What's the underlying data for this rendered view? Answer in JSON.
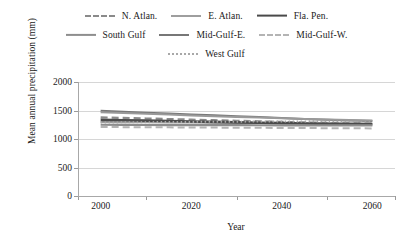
{
  "chart_data": {
    "type": "line",
    "title": "",
    "xlabel": "Year",
    "ylabel": "Mean annual precipitation (mm)",
    "xlim": [
      1995,
      2065
    ],
    "ylim": [
      0,
      2000
    ],
    "xticks": [
      2000,
      2020,
      2040,
      2060
    ],
    "yticks": [
      0,
      500,
      1000,
      1500,
      2000
    ],
    "grid": true,
    "legend_position": "top",
    "x": [
      2000,
      2005,
      2010,
      2015,
      2020,
      2025,
      2030,
      2035,
      2040,
      2045,
      2050,
      2055,
      2060
    ],
    "series": [
      {
        "name": "N. Atlan.",
        "style": "dashed",
        "color": "#8a8a8a",
        "width": 2.2,
        "values": [
          1380,
          1370,
          1360,
          1350,
          1340,
          1330,
          1320,
          1310,
          1300,
          1290,
          1285,
          1280,
          1275
        ]
      },
      {
        "name": "E. Atlan.",
        "style": "solid",
        "color": "#9e9e9e",
        "width": 2.0,
        "values": [
          1300,
          1295,
          1292,
          1290,
          1288,
          1286,
          1283,
          1280,
          1278,
          1276,
          1274,
          1272,
          1270
        ]
      },
      {
        "name": "Fla. Pen.",
        "style": "solid",
        "color": "#4a4a4a",
        "width": 2.6,
        "values": [
          1335,
          1330,
          1322,
          1315,
          1308,
          1300,
          1292,
          1285,
          1278,
          1272,
          1266,
          1262,
          1258
        ]
      },
      {
        "name": "South Gulf",
        "style": "solid",
        "color": "#8e8e8e",
        "width": 2.2,
        "values": [
          1250,
          1248,
          1246,
          1245,
          1244,
          1243,
          1242,
          1241,
          1240,
          1240,
          1239,
          1238,
          1238
        ]
      },
      {
        "name": "Mid-Gulf-E.",
        "style": "solid",
        "color": "#777777",
        "width": 2.0,
        "values": [
          1495,
          1480,
          1462,
          1448,
          1432,
          1416,
          1400,
          1384,
          1368,
          1352,
          1338,
          1326,
          1315
        ]
      },
      {
        "name": "Mid-Gulf-W.",
        "style": "dashed",
        "color": "#b4b4b4",
        "width": 2.0,
        "values": [
          1210,
          1208,
          1206,
          1204,
          1202,
          1200,
          1198,
          1196,
          1194,
          1192,
          1190,
          1188,
          1186
        ]
      },
      {
        "name": "West Gulf",
        "style": "dotted",
        "color": "#a8a8a8",
        "width": 2.0,
        "values": [
          1290,
          1292,
          1295,
          1298,
          1300,
          1302,
          1304,
          1306,
          1308,
          1309,
          1310,
          1311,
          1312
        ]
      },
      {
        "name": "Mid-Gulf-E. upper",
        "style": "solid",
        "color": "#9a9a9a",
        "width": 2.0,
        "values": [
          1470,
          1456,
          1442,
          1428,
          1414,
          1400,
          1388,
          1376,
          1364,
          1352,
          1342,
          1334,
          1326
        ]
      }
    ]
  },
  "legend": {
    "rows": [
      [
        {
          "label": "N. Atlan.",
          "style": "dashed",
          "color": "#8a8a8a",
          "width": 2.2
        },
        {
          "label": "E. Atlan.",
          "style": "solid",
          "color": "#9e9e9e",
          "width": 2.0
        },
        {
          "label": "Fla. Pen.",
          "style": "solid",
          "color": "#4a4a4a",
          "width": 2.8
        }
      ],
      [
        {
          "label": "South Gulf",
          "style": "solid",
          "color": "#8e8e8e",
          "width": 2.2
        },
        {
          "label": "Mid-Gulf-E.",
          "style": "solid",
          "color": "#777777",
          "width": 2.0
        },
        {
          "label": "Mid-Gulf-W.",
          "style": "dashed",
          "color": "#b4b4b4",
          "width": 2.0
        }
      ],
      [
        {
          "label": "West Gulf",
          "style": "dotted",
          "color": "#a8a8a8",
          "width": 2.0
        }
      ]
    ]
  },
  "axes": {
    "ylabel": "Mean annual precipitation (mm)",
    "xlabel": "Year",
    "ytick_labels": [
      "2000",
      "1500",
      "1000",
      "500",
      "0"
    ],
    "xtick_labels": [
      "2000",
      "2020",
      "2040",
      "2060"
    ]
  },
  "colors": {
    "gridline": "#d6d6d6",
    "axis": "#a8a8a8",
    "text": "#1a1a1a",
    "background": "#ffffff"
  }
}
